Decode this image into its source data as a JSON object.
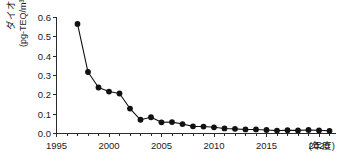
{
  "chart_data": {
    "type": "line",
    "title": "",
    "subtitle": "",
    "xlabel": "(年度)",
    "ylabel": "ダイオキシン類濃度",
    "ylabel_unit": "(pg-TEQ/m³)",
    "xlim": [
      1995,
      2022
    ],
    "ylim": [
      0.0,
      0.6
    ],
    "grid": false,
    "legend": false,
    "legend_position": "none",
    "x_ticks": [
      1995,
      2000,
      2005,
      2010,
      2015,
      2020
    ],
    "x_tick_labels": [
      "1995",
      "2000",
      "2005",
      "2010",
      "2015",
      "2020"
    ],
    "x_minor_tick_interval": 1,
    "y_ticks": [
      0.0,
      0.1,
      0.2,
      0.3,
      0.4,
      0.5,
      0.6
    ],
    "y_tick_labels": [
      "0.0",
      "0.1",
      "0.2",
      "0.3",
      "0.4",
      "0.5",
      "0.6"
    ],
    "marker": "filled-circle",
    "line_color": "#111111",
    "marker_color": "#111111",
    "axis_color": "#2b2b2b",
    "background_color": "#ffffff",
    "x": [
      1997,
      1998,
      1999,
      2000,
      2001,
      2002,
      2003,
      2004,
      2005,
      2006,
      2007,
      2008,
      2009,
      2010,
      2011,
      2012,
      2013,
      2014,
      2015,
      2016,
      2017,
      2018,
      2019,
      2020,
      2021
    ],
    "values": [
      0.567,
      0.318,
      0.238,
      0.217,
      0.207,
      0.129,
      0.071,
      0.084,
      0.058,
      0.059,
      0.049,
      0.037,
      0.036,
      0.032,
      0.026,
      0.024,
      0.021,
      0.021,
      0.018,
      0.015,
      0.017,
      0.016,
      0.018,
      0.016,
      0.014
    ],
    "series": [
      {
        "name": "ダイオキシン類濃度",
        "values": [
          0.567,
          0.318,
          0.238,
          0.217,
          0.207,
          0.129,
          0.071,
          0.084,
          0.058,
          0.059,
          0.049,
          0.037,
          0.036,
          0.032,
          0.026,
          0.024,
          0.021,
          0.021,
          0.018,
          0.015,
          0.017,
          0.016,
          0.018,
          0.016,
          0.014
        ]
      }
    ]
  },
  "ylabel_chars": [
    "ダ",
    "イ",
    "オ",
    "キ",
    "シ",
    "ン",
    "類",
    "濃",
    "度"
  ]
}
